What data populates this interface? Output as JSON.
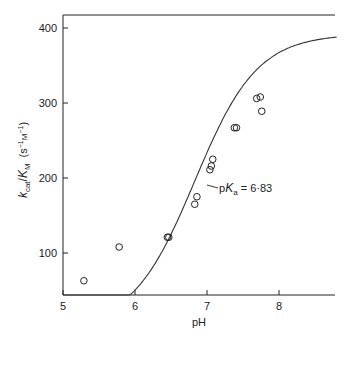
{
  "chart_data": {
    "type": "scatter",
    "title": "",
    "xlabel": "pH",
    "ylabel": "kcat/KM (s⁻¹ M⁻¹)",
    "ylabel_parts": {
      "k": "k",
      "cat": "cat",
      "slash": "/",
      "K": "K",
      "M": "M",
      "units": "(s",
      "sup1": "−1",
      "unitM": "M",
      "sup2": "−1",
      "close": ")"
    },
    "xlim": [
      5,
      8.8
    ],
    "ylim": [
      43,
      416
    ],
    "x_ticks": [
      5,
      6,
      7,
      8
    ],
    "x_tick_labels": [
      "5",
      "6",
      "7",
      "8"
    ],
    "y_ticks": [
      100,
      200,
      300,
      400
    ],
    "y_tick_labels": [
      "100",
      "200",
      "300",
      "400"
    ],
    "grid": false,
    "legend": null,
    "annotation": {
      "text_p": "p",
      "text_K": "K",
      "text_sub": "a",
      "text_val": " = 6·83",
      "x": 6.83,
      "pKa": 6.83
    },
    "series": [
      {
        "name": "observed",
        "marker": "open-circle",
        "points": [
          {
            "x": 5.29,
            "y": 63
          },
          {
            "x": 5.78,
            "y": 108
          },
          {
            "x": 6.45,
            "y": 121
          },
          {
            "x": 6.47,
            "y": 121
          },
          {
            "x": 6.83,
            "y": 165
          },
          {
            "x": 6.86,
            "y": 175
          },
          {
            "x": 7.04,
            "y": 211
          },
          {
            "x": 7.06,
            "y": 216
          },
          {
            "x": 7.08,
            "y": 225
          },
          {
            "x": 7.38,
            "y": 267
          },
          {
            "x": 7.41,
            "y": 267
          },
          {
            "x": 7.69,
            "y": 306
          },
          {
            "x": 7.74,
            "y": 308
          },
          {
            "x": 7.76,
            "y": 289
          }
        ]
      },
      {
        "name": "fitted titration curve",
        "marker": "line",
        "model": "kcat/KM = Vmax / (1 + 10^(pKa - pH))",
        "pKa": 6.83,
        "max": 392
      }
    ]
  }
}
